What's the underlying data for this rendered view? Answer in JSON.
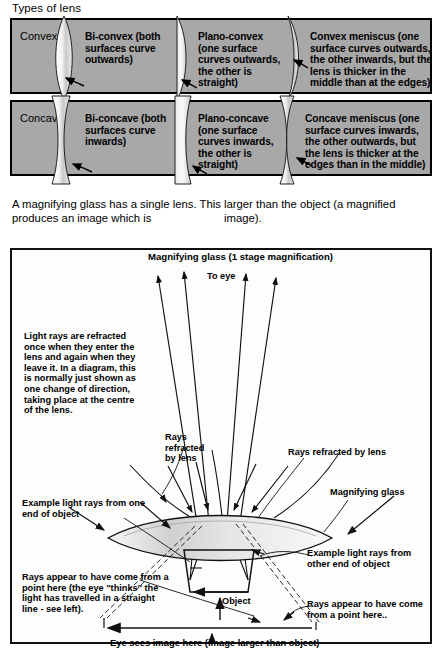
{
  "lens_table": {
    "title": "Types of lens",
    "rows": [
      {
        "label": "Convex",
        "cells": [
          {
            "icon": "bi-convex-lens-icon",
            "text": "Bi-convex (both surfaces curve outwards)"
          },
          {
            "icon": "plano-convex-lens-icon",
            "text": "Plano-convex (one surface curves outwards, the other is straight)"
          },
          {
            "icon": "convex-meniscus-lens-icon",
            "text": "Convex meniscus (one surface curves outwards, the other inwards, but the lens is thicker in the middle than at the edges)"
          }
        ]
      },
      {
        "label": "Concave",
        "cells": [
          {
            "icon": "bi-concave-lens-icon",
            "text": "Bi-concave (both surfaces curve inwards)"
          },
          {
            "icon": "plano-concave-lens-icon",
            "text": "Plano-concave (one surface curves inwards, the other is straight)"
          },
          {
            "icon": "concave-meniscus-lens-icon",
            "text": "Concave meniscus (one surface curves inwards, the other outwards, but the lens is thicker at the edges than in the middle)"
          }
        ]
      }
    ]
  },
  "intro": {
    "left": "A magnifying glass has a single lens. This produces an image which is",
    "right": "larger than the object (a magnified image)."
  },
  "diagram": {
    "title": "Magnifying glass (1 stage magnification)",
    "to_eye": "To eye",
    "refraction_note": "Light rays are refracted once when they enter the lens and again when they leave it. In a diagram, this is normally just shown as one change of direction, taking place at the centre of the lens.",
    "rays_by_lens": "Rays refracted by lens",
    "rays_refracted_by_lens": "Rays refracted by lens",
    "magnifying_glass": "Magnifying glass",
    "example_rays_one_end": "Example light rays from one end of object",
    "example_rays_other_end": "Example light rays from other end of object",
    "appear_left": "Rays appear to have come from a point here (the eye \"thinks\" the light has travelled in a straight line - see left).",
    "appear_right": "Rays appear to have come from a point here..",
    "object": "Object",
    "eye_sees": "Eye sees image here (image larger than object)"
  },
  "colors": {
    "table_fill": "#a8a8a8",
    "border": "#000000",
    "lens_glass_light": "#ffffff",
    "lens_glass_mid": "#b9b9b9",
    "page_bg": "#ffffff"
  }
}
